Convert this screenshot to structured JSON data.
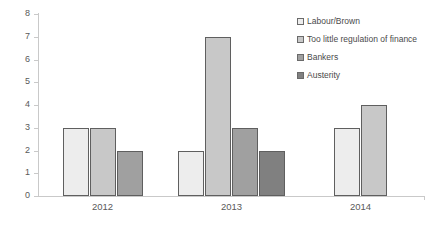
{
  "chart_data": {
    "type": "bar",
    "title": "",
    "subtitle": "",
    "xlabel": "",
    "ylabel": "",
    "categories": [
      "2012",
      "2013",
      "2014"
    ],
    "ylim": [
      0,
      8
    ],
    "yticks": [
      0,
      1,
      2,
      3,
      4,
      5,
      6,
      7,
      8
    ],
    "grid": false,
    "legend_position": "top-right",
    "series": [
      {
        "name": "Labour/Brown",
        "color": "#ededed",
        "values": [
          3,
          2,
          3
        ]
      },
      {
        "name": "Too little regulation of finance",
        "color": "#c8c8c8",
        "values": [
          3,
          7,
          4
        ]
      },
      {
        "name": "Bankers",
        "color": "#a0a0a0",
        "values": [
          2,
          3,
          null
        ]
      },
      {
        "name": "Austerity",
        "color": "#808080",
        "values": [
          null,
          2,
          null
        ]
      }
    ]
  },
  "axes": {
    "tick_labels": [
      "0",
      "1",
      "2",
      "3",
      "4",
      "5",
      "6",
      "7",
      "8"
    ],
    "category_labels": [
      "2012",
      "2013",
      "2014"
    ],
    "axis_color": "#c9c9c9",
    "tick_text_color": "#595959"
  },
  "legend": {
    "items": [
      {
        "label": "Labour/Brown",
        "color": "#ededed"
      },
      {
        "label": "Too little regulation of finance",
        "color": "#c8c8c8"
      },
      {
        "label": "Bankers",
        "color": "#a0a0a0"
      },
      {
        "label": "Austerity",
        "color": "#808080"
      }
    ]
  }
}
